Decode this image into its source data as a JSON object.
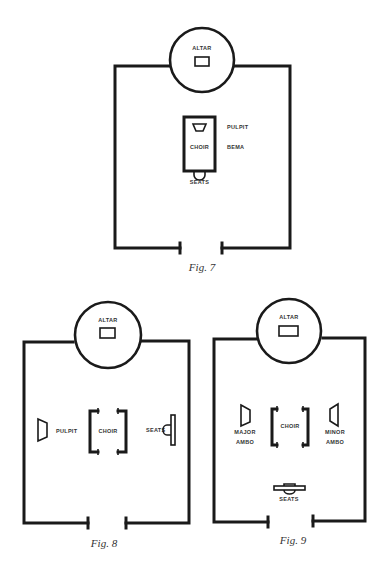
{
  "figures": [
    {
      "caption": "Fig. 7",
      "labels": {
        "altar": "ALTAR",
        "pulpit": "PULPIT",
        "choir": "CHOIR",
        "bema": "BEMA",
        "seats": "SEATS"
      }
    },
    {
      "caption": "Fig. 8",
      "labels": {
        "altar": "ALTAR",
        "pulpit": "PULPIT",
        "choir": "CHOIR",
        "seats": "SEATS"
      }
    },
    {
      "caption": "Fig. 9",
      "labels": {
        "altar": "ALTAR",
        "major_ambo_1": "MAJOR",
        "major_ambo_2": "AMBO",
        "choir": "CHOIR",
        "minor_ambo_1": "MINOR",
        "minor_ambo_2": "AMBO",
        "seats": "SEATS"
      }
    }
  ],
  "colors": {
    "ink": "#1a1a1a",
    "paper": "#ffffff"
  }
}
